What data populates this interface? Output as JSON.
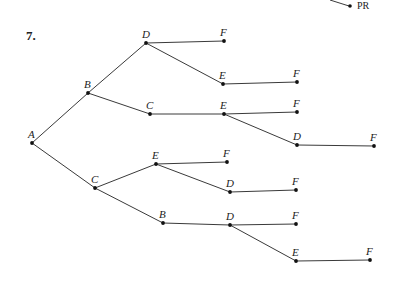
{
  "problem_number": "7.",
  "corner_label": "PR",
  "tree": {
    "nodes": [
      {
        "id": "A",
        "label": "A"
      },
      {
        "id": "B",
        "label": "B"
      },
      {
        "id": "C1",
        "label": "C"
      },
      {
        "id": "D1",
        "label": "D"
      },
      {
        "id": "F1",
        "label": "F"
      },
      {
        "id": "E1",
        "label": "E"
      },
      {
        "id": "F2",
        "label": "F"
      },
      {
        "id": "C2",
        "label": "C"
      },
      {
        "id": "E2",
        "label": "E"
      },
      {
        "id": "F3",
        "label": "F"
      },
      {
        "id": "D2",
        "label": "D"
      },
      {
        "id": "F4",
        "label": "F"
      },
      {
        "id": "C3",
        "label": "C"
      },
      {
        "id": "E3",
        "label": "E"
      },
      {
        "id": "F5",
        "label": "F"
      },
      {
        "id": "D3",
        "label": "D"
      },
      {
        "id": "F6",
        "label": "F"
      },
      {
        "id": "B2",
        "label": "B"
      },
      {
        "id": "D4",
        "label": "D"
      },
      {
        "id": "F7",
        "label": "F"
      },
      {
        "id": "E4",
        "label": "E"
      },
      {
        "id": "F8",
        "label": "F"
      }
    ],
    "edges": [
      [
        "A",
        "B"
      ],
      [
        "B",
        "D1"
      ],
      [
        "D1",
        "F1"
      ],
      [
        "D1",
        "E1"
      ],
      [
        "E1",
        "F2"
      ],
      [
        "B",
        "C2"
      ],
      [
        "C2",
        "E2"
      ],
      [
        "E2",
        "F3"
      ],
      [
        "E2",
        "D2"
      ],
      [
        "D2",
        "F4"
      ],
      [
        "A",
        "C3"
      ],
      [
        "C3",
        "E3"
      ],
      [
        "E3",
        "F5"
      ],
      [
        "E3",
        "D3"
      ],
      [
        "D3",
        "F6"
      ],
      [
        "C3",
        "B2"
      ],
      [
        "B2",
        "D4"
      ],
      [
        "D4",
        "F7"
      ],
      [
        "D4",
        "E4"
      ],
      [
        "E4",
        "F8"
      ]
    ]
  }
}
